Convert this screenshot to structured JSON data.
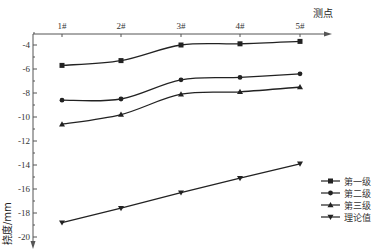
{
  "chart_data": {
    "type": "line",
    "title": "",
    "xlabel": "测点",
    "ylabel": "挠度/mm",
    "categories": [
      "1#",
      "2#",
      "3#",
      "4#",
      "5#"
    ],
    "x_axis_position": "top",
    "ylim": [
      -20,
      -3
    ],
    "y_ticks": [
      -4,
      -6,
      -8,
      -10,
      -12,
      -14,
      -16,
      -18,
      -20
    ],
    "y_tick_labels": [
      "-4",
      "-6",
      "-8",
      "-10",
      "-12",
      "-14",
      "-16",
      "-18",
      "-20"
    ],
    "grid": false,
    "legend_position": "lower right",
    "series": [
      {
        "name": "第一级",
        "marker": "square",
        "smooth": true,
        "values": [
          -5.7,
          -5.3,
          -4.0,
          -3.9,
          -3.7
        ]
      },
      {
        "name": "第二级",
        "marker": "circle",
        "smooth": true,
        "values": [
          -8.6,
          -8.5,
          -6.9,
          -6.7,
          -6.4
        ]
      },
      {
        "name": "第三级",
        "marker": "triangle-up",
        "smooth": true,
        "values": [
          -10.6,
          -9.8,
          -8.1,
          -7.9,
          -7.5
        ]
      },
      {
        "name": "理论值",
        "marker": "triangle-down",
        "smooth": false,
        "values": [
          -18.8,
          -17.6,
          -16.3,
          -15.1,
          -13.9
        ]
      }
    ]
  },
  "colors": {
    "line": "#222222",
    "axis": "#555555"
  }
}
